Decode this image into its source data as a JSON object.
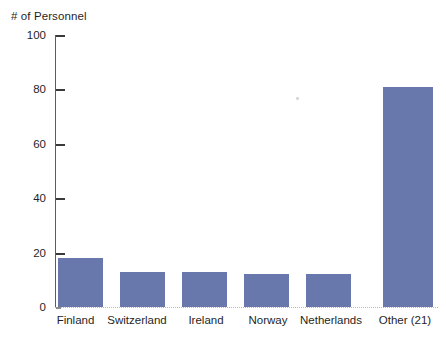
{
  "chart_data": {
    "type": "bar",
    "title": "# of Personnel",
    "xlabel": "",
    "ylabel": "# of Personnel",
    "categories": [
      "Finland",
      "Switzerland",
      "Ireland",
      "Norway",
      "Netherlands",
      "Other (21)"
    ],
    "values": [
      18,
      13,
      13,
      12,
      12,
      81
    ],
    "ylim": [
      0,
      100
    ],
    "yticks": [
      0,
      20,
      40,
      60,
      80,
      100
    ],
    "ytick_labels": [
      "0",
      "20",
      "40",
      "60",
      "80",
      "100"
    ],
    "grid": false,
    "legend": false,
    "legend_position": "none",
    "series": [
      {
        "name": "# of Personnel",
        "values": [
          18,
          13,
          13,
          12,
          12,
          81
        ],
        "color": "#6878ad"
      }
    ],
    "bar_color": "#6878ad",
    "background_color": "#ffffff",
    "axis_color": "#5c5c5c"
  },
  "axis": {
    "y_caption": "# of Personnel",
    "tick_0": "0",
    "tick_20": "20",
    "tick_40": "40",
    "tick_60": "60",
    "tick_80": "80",
    "tick_100": "100"
  },
  "categories": {
    "c0": "Finland",
    "c1": "Switzerland",
    "c2": "Ireland",
    "c3": "Norway",
    "c4": "Netherlands",
    "c5": "Other (21)"
  }
}
